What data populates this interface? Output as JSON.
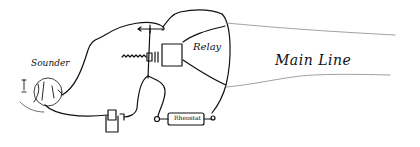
{
  "diagram": {
    "type": "hand-drawn circuit sketch",
    "labels": {
      "sounder": "Sounder",
      "relay": "Relay",
      "resistor": "Rheostat",
      "main_line": "Main Line"
    },
    "components": [
      {
        "name": "sounder",
        "label": "Sounder"
      },
      {
        "name": "relay",
        "label": "Relay"
      },
      {
        "name": "spring-contact",
        "label": ""
      },
      {
        "name": "battery",
        "label": ""
      },
      {
        "name": "resistor",
        "label": "Rheostat"
      },
      {
        "name": "main-line",
        "label": "Main Line"
      }
    ],
    "colors": {
      "ink": "#111111",
      "faint_ink": "#888888",
      "paper": "#ffffff"
    }
  }
}
